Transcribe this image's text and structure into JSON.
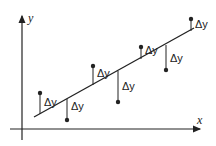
{
  "diagram": {
    "title": "",
    "axes": {
      "x_label": "x",
      "y_label": "y"
    },
    "delta_label": "Δy",
    "colors": {
      "stroke": "#222222",
      "background": "#ffffff"
    },
    "regression_line": {
      "x1": 34,
      "y1": 117,
      "x2": 194,
      "y2": 28
    },
    "points": [
      {
        "px": 40,
        "py": 93,
        "lx": 40,
        "ly": 114,
        "label_x": 44,
        "label_y": 106
      },
      {
        "px": 67,
        "py": 120,
        "lx": 67,
        "ly": 99,
        "label_x": 71,
        "label_y": 110
      },
      {
        "px": 93,
        "py": 66,
        "lx": 93,
        "ly": 85,
        "label_x": 97,
        "label_y": 77
      },
      {
        "px": 118,
        "py": 102,
        "lx": 118,
        "ly": 71,
        "label_x": 122,
        "label_y": 90
      },
      {
        "px": 141,
        "py": 47,
        "lx": 141,
        "ly": 59,
        "label_x": 145,
        "label_y": 54
      },
      {
        "px": 166,
        "py": 70,
        "lx": 166,
        "ly": 45,
        "label_x": 170,
        "label_y": 62
      },
      {
        "px": 191,
        "py": 19,
        "lx": 191,
        "ly": 31,
        "label_x": 195,
        "label_y": 28
      }
    ]
  }
}
